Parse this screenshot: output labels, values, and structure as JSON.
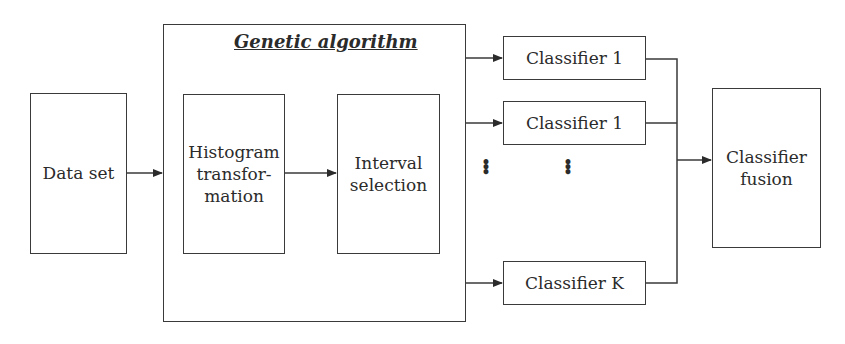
{
  "diagram": {
    "data_set": {
      "label": "Data set"
    },
    "genetic_algorithm": {
      "title": "Genetic algorithm",
      "histogram": {
        "label": "Histogram transfor- mation",
        "lines": [
          "Histogram",
          "transfor-",
          "mation"
        ]
      },
      "interval": {
        "lines": [
          "Interval",
          "selection"
        ]
      }
    },
    "classifiers": [
      {
        "label": "Classifier 1"
      },
      {
        "label": "Classifier 1"
      },
      {
        "label": "Classifier K"
      }
    ],
    "ellipsis": "⋮",
    "fusion": {
      "lines": [
        "Classifier",
        "fusion"
      ]
    },
    "colors": {
      "stroke": "#3a3a3a",
      "background": "#ffffff"
    }
  }
}
